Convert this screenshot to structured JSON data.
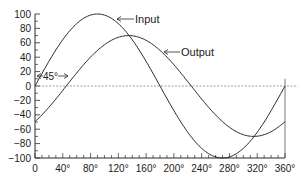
{
  "chart_data": {
    "type": "line",
    "title": "",
    "xlabel": "",
    "ylabel": "",
    "xlim": [
      0,
      360
    ],
    "ylim": [
      -100,
      100
    ],
    "x_ticks": [
      "0",
      "40°",
      "80°",
      "120°",
      "160°",
      "200°",
      "240°",
      "280°",
      "320°",
      "360°"
    ],
    "y_ticks": [
      "100",
      "80",
      "60",
      "40",
      "20",
      "0",
      "−20",
      "−40",
      "−60",
      "−80",
      "−100"
    ],
    "grid": false,
    "legend": "inline arrow labels",
    "series": [
      {
        "name": "Input",
        "amplitude": 100,
        "phase_deg": 0,
        "formula": "100*sin(x)",
        "x": [
          0,
          45,
          90,
          135,
          180,
          225,
          270,
          315,
          360
        ],
        "values": [
          0,
          70.7,
          100,
          70.7,
          0,
          -70.7,
          -100,
          -70.7,
          0
        ]
      },
      {
        "name": "Output",
        "amplitude": 70,
        "phase_deg": -45,
        "formula": "70*sin(x-45)",
        "x": [
          0,
          45,
          90,
          135,
          180,
          225,
          270,
          315,
          360
        ],
        "values": [
          -49.5,
          0,
          49.5,
          70,
          49.5,
          0,
          -49.5,
          -70,
          -49.5
        ]
      }
    ],
    "annotations": [
      {
        "text": "Input",
        "type": "arrow-label"
      },
      {
        "text": "Output",
        "type": "arrow-label"
      },
      {
        "text": "45°",
        "type": "phase-shift-arrow"
      }
    ],
    "reference_line": {
      "y": 0,
      "style": "dashed"
    }
  },
  "labels": {
    "input": "Input",
    "output": "Output",
    "phase": "45°"
  }
}
